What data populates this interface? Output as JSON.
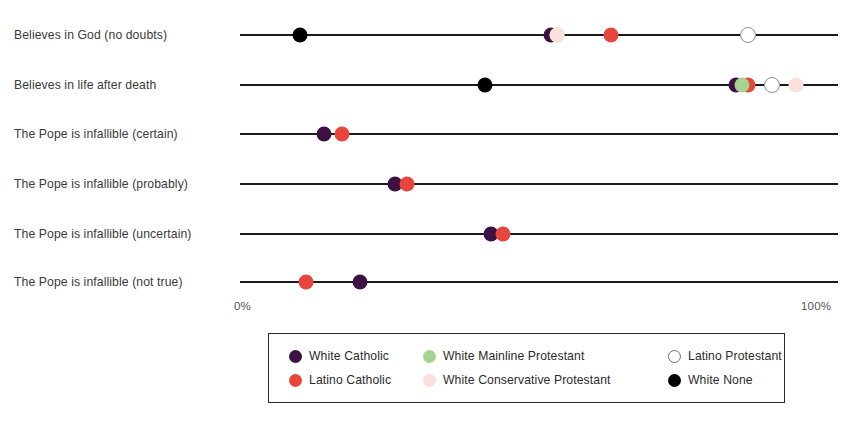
{
  "chart_data": {
    "type": "scatter",
    "subtype": "dot-plot",
    "title": "",
    "xlabel": "",
    "ylabel": "",
    "xlim": [
      0,
      100
    ],
    "grid": false,
    "legend_position": "bottom",
    "axis_ticks": [
      "0%",
      "100%"
    ],
    "categories": [
      "Believes in God (no doubts)",
      "Believes in life after death",
      "The Pope is infallible (certain)",
      "The Pope is infallible (probably)",
      "The Pope is infallible (uncertain)",
      "The Pope is infallible (not true)"
    ],
    "series": [
      {
        "name": "White Catholic",
        "color": "#3E1144",
        "style": "filled",
        "values": [
          52,
          83,
          14,
          26,
          42,
          20
        ]
      },
      {
        "name": "Latino Catholic",
        "color": "#E8453C",
        "style": "filled",
        "values": [
          62,
          85,
          17,
          28,
          44,
          11
        ]
      },
      {
        "name": "White Mainline Protestant",
        "color": "#A6D490",
        "style": "filled",
        "values": [
          53,
          84,
          null,
          null,
          null,
          null
        ]
      },
      {
        "name": "White Conservative Protestant",
        "color": "#FADFDC",
        "style": "filled",
        "values": [
          53,
          93,
          null,
          null,
          null,
          null
        ]
      },
      {
        "name": "Latino Protestant",
        "color": "#FFFFFF",
        "style": "open",
        "values": [
          85,
          89,
          null,
          null,
          null,
          null
        ]
      },
      {
        "name": "White None",
        "color": "#000000",
        "style": "filled",
        "values": [
          10,
          41,
          null,
          null,
          null,
          null
        ]
      }
    ]
  },
  "axis": {
    "min_label": "0%",
    "max_label": "100%"
  },
  "legend": {
    "items": [
      {
        "label": "White Catholic",
        "color": "#3E1144",
        "style": "filled"
      },
      {
        "label": "White Mainline Protestant",
        "color": "#A6D490",
        "style": "filled"
      },
      {
        "label": "Latino Protestant",
        "color": "#FFFFFF",
        "style": "open"
      },
      {
        "label": "Latino Catholic",
        "color": "#E8453C",
        "style": "filled"
      },
      {
        "label": "White Conservative Protestant",
        "color": "#FADFDC",
        "style": "filled"
      },
      {
        "label": "White None",
        "color": "#000000",
        "style": "filled"
      }
    ]
  }
}
